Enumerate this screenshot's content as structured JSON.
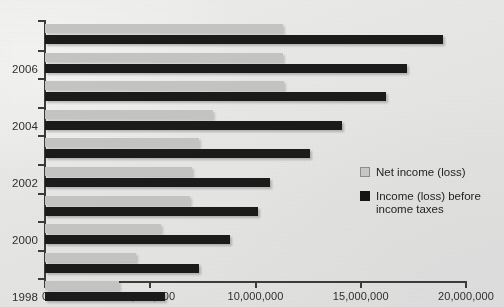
{
  "chart_data": {
    "type": "bar",
    "orientation": "horizontal",
    "title": "",
    "xlabel": "",
    "ylabel": "",
    "categories": [
      "1998",
      "1999",
      "2000",
      "2001",
      "2002",
      "2003",
      "2004",
      "2005",
      "2006"
    ],
    "category_tick_labels": [
      "1998",
      "",
      "2000",
      "",
      "2002",
      "",
      "2004",
      "",
      "2006"
    ],
    "series": [
      {
        "name": "Net income (loss)",
        "color": "#c3c3c1",
        "values": [
          3500000,
          4300000,
          5500000,
          6900000,
          7000000,
          7300000,
          8000000,
          11350000,
          11300000
        ]
      },
      {
        "name": "Income (loss) before income taxes",
        "color": "#1b1b1b",
        "values": [
          5700000,
          7300000,
          8800000,
          10100000,
          10700000,
          12600000,
          14100000,
          16200000,
          17200000
        ]
      }
    ],
    "extra_top_group": {
      "note": "topmost pair above 2006 row",
      "net": 11300000,
      "pre": 18900000
    },
    "xticks": [
      0,
      5000000,
      10000000,
      15000000,
      20000000
    ],
    "xtick_labels": [
      "0",
      "5,000,000",
      "10,000,000",
      "15,000,000",
      "20,000,000"
    ],
    "xlim": [
      0,
      20000000
    ],
    "grid": false,
    "legend_position": "middle-right"
  },
  "legend": {
    "items": [
      {
        "label": "Net income (loss)",
        "swatch": "net"
      },
      {
        "label": "Income (loss) before income taxes",
        "swatch": "pre"
      }
    ]
  },
  "colors": {
    "net_income": "#c3c3c1",
    "pretax_income": "#1b1b1b",
    "axis": "#3b3b3b",
    "text": "#2e2e2e",
    "background": "#e9e9e7"
  }
}
